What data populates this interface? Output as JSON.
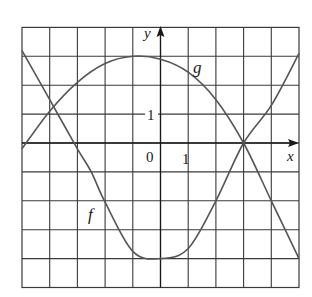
{
  "chart_data": {
    "type": "line",
    "title": "",
    "xlabel": "x",
    "ylabel": "y",
    "xlim": [
      -5,
      5
    ],
    "ylim": [
      -5,
      4
    ],
    "grid": true,
    "tick_labels": {
      "origin": "0",
      "x_one": "1",
      "y_one": "1"
    },
    "series": [
      {
        "name": "f",
        "x": [
          -5,
          -4,
          -3,
          -2.5,
          -2,
          -1,
          0,
          1,
          2,
          3,
          4,
          5
        ],
        "y": [
          3.2,
          1.5,
          -0.2,
          -1,
          -2.05,
          -3.75,
          -4,
          -3.65,
          -2,
          0,
          1.3,
          3.1
        ]
      },
      {
        "name": "g",
        "x": [
          -5,
          -4,
          -3,
          -2,
          -1,
          0,
          1,
          2,
          3,
          4,
          5
        ],
        "y": [
          -0.2,
          1.1,
          2.1,
          2.75,
          3,
          2.9,
          2.45,
          1.5,
          0,
          -2,
          -4
        ]
      }
    ],
    "annotations": [
      {
        "text": "f",
        "x": -2.5,
        "y": -2.5
      },
      {
        "text": "g",
        "x": 1.3,
        "y": 2.6
      }
    ]
  },
  "labels": {
    "x_axis": "x",
    "y_axis": "y",
    "origin": "0",
    "x_tick_1": "1",
    "y_tick_1": "1",
    "f_label": "f",
    "g_label": "g"
  },
  "colors": {
    "grid": "#3a3a3a",
    "curve": "#555555",
    "text": "#1a1a1a"
  }
}
